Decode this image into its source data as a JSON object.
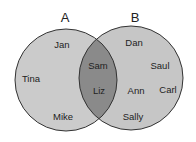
{
  "diagram": {
    "type": "venn",
    "sets": [
      {
        "label": "A",
        "only_members": [
          "Jan",
          "Tina",
          "Mike"
        ]
      },
      {
        "label": "B",
        "only_members": [
          "Dan",
          "Saul",
          "Carl",
          "Ann",
          "Sally"
        ]
      }
    ],
    "intersection": [
      "Sam",
      "Liz"
    ],
    "colors": {
      "circle_fill": "#c9c9c9",
      "intersection_fill": "#8a8a8a",
      "stroke": "#333333"
    }
  },
  "labels": {
    "set_a": "A",
    "set_b": "B",
    "a_only": {
      "jan": "Jan",
      "tina": "Tina",
      "mike": "Mike"
    },
    "both": {
      "sam": "Sam",
      "liz": "Liz"
    },
    "b_only": {
      "dan": "Dan",
      "saul": "Saul",
      "carl": "Carl",
      "ann": "Ann",
      "sally": "Sally"
    }
  }
}
